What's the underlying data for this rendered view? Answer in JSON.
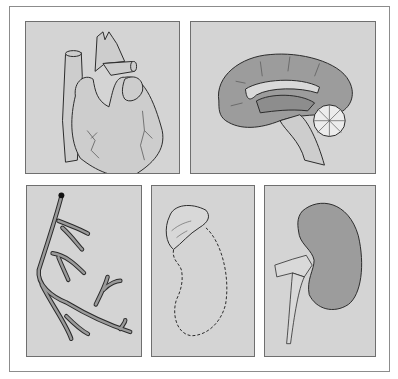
{
  "figure": {
    "panels": [
      {
        "id": "heart",
        "label": "Heart illustration"
      },
      {
        "id": "brain",
        "label": "Brain sagittal section illustration"
      },
      {
        "id": "vessel",
        "label": "Branching blood vessel illustration"
      },
      {
        "id": "adrenal",
        "label": "Adrenal gland with dashed kidney outline"
      },
      {
        "id": "kidney",
        "label": "Kidney with ureter illustration"
      }
    ],
    "colors": {
      "panel_bg": "#d4d4d4",
      "organ_fill_dark": "#9a9a9a",
      "organ_fill_light": "#cfcfcf",
      "line": "#2a2a2a"
    }
  }
}
